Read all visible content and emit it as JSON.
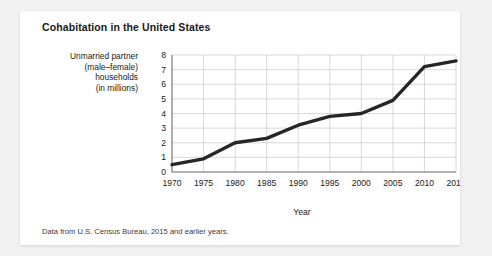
{
  "figure": {
    "title": "Cohabitation in the United States",
    "source_note": "Data from U.S. Census Bureau, 2015 and earlier years.",
    "ylabel_lines": [
      "Unmarried partner",
      "(male–female)",
      "households",
      "(in millions)"
    ],
    "xlabel": "Year"
  },
  "chart_data": {
    "type": "line",
    "title": "Cohabitation in the United States",
    "xlabel": "Year",
    "ylabel": "Unmarried partner (male–female) households (in millions)",
    "x": [
      1970,
      1975,
      1980,
      1985,
      1990,
      1995,
      2000,
      2005,
      2010,
      2015
    ],
    "values": [
      0.5,
      0.9,
      2.0,
      2.3,
      3.2,
      3.8,
      4.0,
      4.9,
      7.2,
      7.6
    ],
    "xlim": [
      1970,
      2015
    ],
    "ylim": [
      0,
      8
    ],
    "xticks": [
      1970,
      1975,
      1980,
      1985,
      1990,
      1995,
      2000,
      2005,
      2010,
      2015
    ],
    "yticks": [
      0,
      1,
      2,
      3,
      4,
      5,
      6,
      7,
      8
    ],
    "xtick_labels": [
      "1970",
      "1975",
      "1980",
      "1985",
      "1990",
      "1995",
      "2000",
      "2005",
      "2010",
      "2015"
    ],
    "ytick_labels": [
      "0",
      "1",
      "2",
      "3",
      "4",
      "5",
      "6",
      "7",
      "8"
    ],
    "grid": true,
    "legend": null,
    "line_color": "#262626",
    "grid_color": "#c8c8c8",
    "axis_color": "#7a7a7a"
  }
}
